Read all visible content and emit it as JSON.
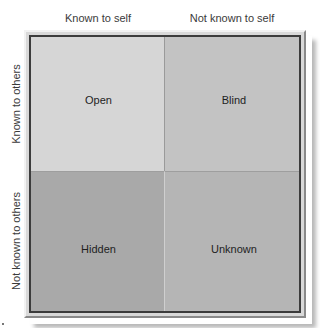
{
  "diagram": {
    "type": "Johari window",
    "columns": [
      {
        "label": "Known to self"
      },
      {
        "label": "Not known to self"
      }
    ],
    "rows": [
      {
        "label": "Known to others"
      },
      {
        "label": "Not known to others"
      }
    ],
    "quadrants": [
      {
        "label": "Open",
        "row": 0,
        "col": 0,
        "color": "#d6d6d6"
      },
      {
        "label": "Blind",
        "row": 0,
        "col": 1,
        "color": "#c3c3c3"
      },
      {
        "label": "Hidden",
        "row": 1,
        "col": 0,
        "color": "#a9a9a9"
      },
      {
        "label": "Unknown",
        "row": 1,
        "col": 1,
        "color": "#b5b5b5"
      }
    ],
    "frame": {
      "outer_color": "#d9d9d9",
      "inner_border_color": "#3c3c3c"
    }
  }
}
